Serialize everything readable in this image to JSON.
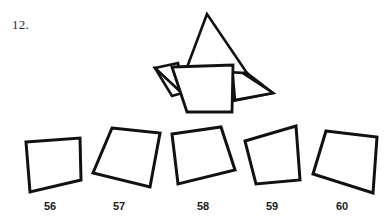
{
  "question": {
    "number_label": "12.",
    "type": "spatial-reasoning-shape-matching"
  },
  "colors": {
    "background": "#ffffff",
    "stroke": "#111111",
    "fill": "#ffffff",
    "text": "#1c1c1c"
  },
  "prompt_figure": {
    "name": "folded-star-figure",
    "description": "star-like folded figure with central quadrilateral",
    "stroke_width": 2.6,
    "parts": [
      {
        "name": "upper-spike",
        "points": "207,14 186,70 247,73"
      },
      {
        "name": "left-spike",
        "points": "155,68 184,95 178,63"
      },
      {
        "name": "left-wing",
        "points": "155,68 172,96 247,74"
      },
      {
        "name": "right-spike",
        "points": "273,93 232,66 235,100"
      },
      {
        "name": "right-wing",
        "points": "247,73 273,93 233,101"
      },
      {
        "name": "central-quad",
        "points": "172,67 233,65 232,112 187,112"
      }
    ]
  },
  "options": [
    {
      "id": "option-56",
      "label": "56",
      "shape_name": "quadrilateral-56",
      "points": "26,142 80,138 81,180 30,192"
    },
    {
      "id": "option-57",
      "label": "57",
      "shape_name": "quadrilateral-57",
      "points": "112,128 160,133 150,187 93,173"
    },
    {
      "id": "option-58",
      "label": "58",
      "shape_name": "quadrilateral-58",
      "points": "172,134 221,127 235,170 178,184"
    },
    {
      "id": "option-59",
      "label": "59",
      "shape_name": "quadrilateral-59",
      "points": "245,141 296,126 300,180 256,184"
    },
    {
      "id": "option-60",
      "label": "60",
      "shape_name": "quadrilateral-60",
      "points": "326,131 377,137 373,193 313,174"
    }
  ]
}
